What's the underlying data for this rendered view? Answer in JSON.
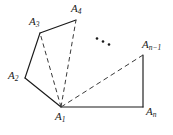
{
  "figure": {
    "kind": "geometry-diagram",
    "canvas": {
      "width": 173,
      "height": 135,
      "background": "#ffffff"
    },
    "stroke_color": "#1a1a1a",
    "dash_color": "#3a3a3a",
    "stroke_width": 1.1,
    "vertices": [
      {
        "id": "A1",
        "base": "A",
        "sub": "1",
        "x": 61,
        "y": 107,
        "label_x": 55,
        "label_y": 111
      },
      {
        "id": "A2",
        "base": "A",
        "sub": "2",
        "x": 25,
        "y": 78,
        "label_x": 8,
        "label_y": 70
      },
      {
        "id": "A3",
        "base": "A",
        "sub": "3",
        "x": 40,
        "y": 33,
        "label_x": 29,
        "label_y": 16
      },
      {
        "id": "A4",
        "base": "A",
        "sub": "4",
        "x": 76,
        "y": 20,
        "label_x": 71,
        "label_y": 3
      },
      {
        "id": "An-1",
        "base": "A",
        "sub": "n−1",
        "x": 143,
        "y": 55,
        "label_x": 142,
        "label_y": 39
      },
      {
        "id": "An",
        "base": "A",
        "sub": "n",
        "x": 143,
        "y": 107,
        "label_x": 146,
        "label_y": 106
      }
    ],
    "solid_edges": [
      {
        "name": "edge-A2-A3",
        "x1": 25,
        "y1": 78,
        "x2": 40,
        "y2": 33
      },
      {
        "name": "edge-A3-A4",
        "x1": 40,
        "y1": 33,
        "x2": 76,
        "y2": 20
      },
      {
        "name": "edge-A1-A2",
        "x1": 61,
        "y1": 107,
        "x2": 25,
        "y2": 78
      },
      {
        "name": "edge-An1-An",
        "x1": 143,
        "y1": 55,
        "x2": 143,
        "y2": 107
      },
      {
        "name": "edge-An-A1",
        "x1": 143,
        "y1": 107,
        "x2": 61,
        "y2": 107
      }
    ],
    "dashed_diagonals": [
      {
        "name": "diagonal-A1-A3",
        "x1": 61,
        "y1": 107,
        "x2": 40,
        "y2": 33
      },
      {
        "name": "diagonal-A1-A4",
        "x1": 61,
        "y1": 107,
        "x2": 76,
        "y2": 20
      },
      {
        "name": "diagonal-A1-An-1",
        "x1": 61,
        "y1": 107,
        "x2": 143,
        "y2": 55
      }
    ],
    "ellipsis": {
      "label": "...",
      "dots": [
        {
          "cx": 97,
          "cy": 38.5,
          "r": 1.25
        },
        {
          "cx": 103,
          "cy": 41.5,
          "r": 1.25
        },
        {
          "cx": 109,
          "cy": 44.5,
          "r": 1.25
        }
      ]
    }
  }
}
